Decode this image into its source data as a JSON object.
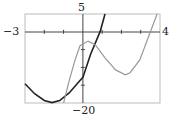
{
  "chart_data": {
    "type": "line",
    "title": "",
    "xlabel": "",
    "ylabel": "",
    "xlim": [
      -3,
      4
    ],
    "ylim": [
      -20,
      5
    ],
    "grid": false,
    "tick_labels": {
      "x_min": "−3",
      "x_max": "4",
      "y_max": "5",
      "y_min": "−20"
    },
    "series": [
      {
        "name": "parabola (dark)",
        "color": "#222222",
        "x": [
          -3.0,
          -2.5,
          -2.0,
          -1.6,
          -1.2,
          -0.7,
          -0.25,
          0.0,
          0.4,
          0.9,
          1.15
        ],
        "y": [
          -14.6,
          -17.4,
          -19.3,
          -19.9,
          -19.3,
          -17.1,
          -14.3,
          -12.8,
          -6.3,
          0.1,
          5.0
        ]
      },
      {
        "name": "cubic (gray)",
        "color": "#999999",
        "x": [
          -1.0,
          -0.7,
          -0.4,
          -0.15,
          0.27,
          0.65,
          1.15,
          1.7,
          2.2,
          2.45,
          2.95,
          3.5,
          3.85
        ],
        "y": [
          -20.0,
          -13.5,
          -7.9,
          -3.9,
          -2.6,
          -3.7,
          -7.3,
          -10.7,
          -12.1,
          -11.5,
          -7.9,
          0.0,
          5.0
        ]
      }
    ]
  },
  "labels": {
    "x_min": "−3",
    "x_max": "4",
    "y_max": "5",
    "y_min": "−20"
  }
}
